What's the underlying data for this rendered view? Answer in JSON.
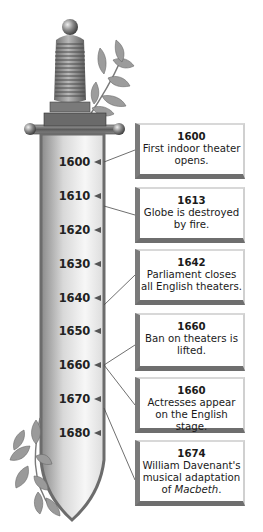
{
  "diagram": {
    "type": "timeline",
    "style": "sword-shaped timeline with decorative laurel branches",
    "axis": {
      "ticks": [
        "1600",
        "1610",
        "1620",
        "1630",
        "1640",
        "1650",
        "1660",
        "1670",
        "1680"
      ]
    },
    "events": [
      {
        "year": "1600",
        "text": "First indoor theater opens."
      },
      {
        "year": "1613",
        "text": "Globe is destroyed by fire."
      },
      {
        "year": "1642",
        "text": "Parliament closes all English theaters."
      },
      {
        "year": "1660",
        "text": "Ban on theaters is lifted."
      },
      {
        "year": "1660",
        "text": "Actresses appear on the English stage."
      },
      {
        "year": "1674",
        "text_prefix": "William Davenant's musical adaptation of ",
        "text_italic": "Macbeth",
        "text_suffix": "."
      }
    ],
    "colors": {
      "blade_dark": "#7a7a7a",
      "blade_light": "#f2f2f2",
      "hilt": "#8a8a8a",
      "box_shadow": "#6e6e6e",
      "leaf": "#9a9a9a"
    }
  }
}
